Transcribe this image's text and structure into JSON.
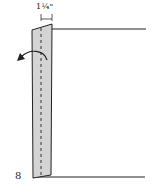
{
  "diagram": {
    "measurement_label": "1¼\"",
    "step_number": "8",
    "strip_fill": "#d4d4d4",
    "line_color": "#222222",
    "arrow_direction": "fold-left"
  }
}
